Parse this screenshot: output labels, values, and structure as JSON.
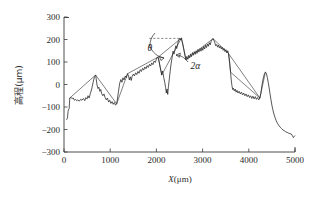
{
  "figure": {
    "background": "#ffffff",
    "line_color": "#1f1f1f"
  },
  "chart_data": {
    "type": "line",
    "title": "",
    "xlabel": "X(μm)",
    "ylabel": "高程(μm)",
    "xlabel_italic_part": "X",
    "xlabel_rest": "(μm)",
    "ylabel_cjk": "高程",
    "ylabel_unit": "(μm)",
    "xlim": [
      0,
      5000
    ],
    "ylim": [
      -300,
      300
    ],
    "xticks": [
      0,
      1000,
      2000,
      3000,
      4000,
      5000
    ],
    "xtick_labels": [
      "0",
      "1000",
      "2000",
      "3000",
      "4000",
      "5000"
    ],
    "yticks": [
      -300,
      -200,
      -100,
      0,
      100,
      200,
      300
    ],
    "ytick_labels": [
      "-300",
      "-200",
      "-100",
      "0",
      "100",
      "200",
      "300"
    ],
    "grid": false,
    "legend": null,
    "legend_position": "none",
    "axis_style": "left-and-bottom-spines",
    "tick_direction": "in",
    "series": [
      {
        "name": "measured surface profile",
        "style": "solid",
        "color": "#1f1f1f",
        "points": [
          [
            60,
            -155
          ],
          [
            75,
            -148
          ],
          [
            88,
            -120
          ],
          [
            100,
            -110
          ],
          [
            112,
            -108
          ],
          [
            125,
            -60
          ],
          [
            150,
            -58
          ],
          [
            175,
            -62
          ],
          [
            200,
            -60
          ],
          [
            225,
            -70
          ],
          [
            250,
            -66
          ],
          [
            275,
            -72
          ],
          [
            300,
            -68
          ],
          [
            330,
            -74
          ],
          [
            360,
            -66
          ],
          [
            390,
            -70
          ],
          [
            420,
            -62
          ],
          [
            450,
            -72
          ],
          [
            470,
            -58
          ],
          [
            500,
            -64
          ],
          [
            520,
            -50
          ],
          [
            545,
            -60
          ],
          [
            570,
            -40
          ],
          [
            600,
            -20
          ],
          [
            630,
            10
          ],
          [
            660,
            35
          ],
          [
            685,
            42
          ],
          [
            700,
            20
          ],
          [
            715,
            -2
          ],
          [
            735,
            -18
          ],
          [
            755,
            -12
          ],
          [
            775,
            -30
          ],
          [
            795,
            -22
          ],
          [
            815,
            -40
          ],
          [
            840,
            -50
          ],
          [
            865,
            -42
          ],
          [
            890,
            -58
          ],
          [
            915,
            -68
          ],
          [
            940,
            -60
          ],
          [
            965,
            -78
          ],
          [
            990,
            -70
          ],
          [
            1015,
            -84
          ],
          [
            1040,
            -76
          ],
          [
            1065,
            -88
          ],
          [
            1090,
            -80
          ],
          [
            1115,
            -92
          ],
          [
            1140,
            -86
          ],
          [
            1160,
            -60
          ],
          [
            1180,
            -30
          ],
          [
            1205,
            5
          ],
          [
            1230,
            22
          ],
          [
            1255,
            10
          ],
          [
            1275,
            30
          ],
          [
            1300,
            20
          ],
          [
            1325,
            38
          ],
          [
            1350,
            30
          ],
          [
            1375,
            48
          ],
          [
            1395,
            40
          ],
          [
            1415,
            20
          ],
          [
            1435,
            34
          ],
          [
            1455,
            18
          ],
          [
            1475,
            36
          ],
          [
            1500,
            46
          ],
          [
            1525,
            38
          ],
          [
            1550,
            52
          ],
          [
            1575,
            44
          ],
          [
            1600,
            58
          ],
          [
            1625,
            50
          ],
          [
            1650,
            66
          ],
          [
            1675,
            58
          ],
          [
            1700,
            72
          ],
          [
            1725,
            64
          ],
          [
            1750,
            78
          ],
          [
            1775,
            70
          ],
          [
            1800,
            84
          ],
          [
            1825,
            76
          ],
          [
            1850,
            90
          ],
          [
            1875,
            82
          ],
          [
            1900,
            96
          ],
          [
            1925,
            88
          ],
          [
            1950,
            104
          ],
          [
            1975,
            98
          ],
          [
            2000,
            112
          ],
          [
            2020,
            122
          ],
          [
            2040,
            118
          ],
          [
            2060,
            100
          ],
          [
            2080,
            78
          ],
          [
            2100,
            60
          ],
          [
            2115,
            42
          ],
          [
            2130,
            60
          ],
          [
            2145,
            48
          ],
          [
            2160,
            30
          ],
          [
            2180,
            10
          ],
          [
            2200,
            -14
          ],
          [
            2215,
            -38
          ],
          [
            2230,
            -20
          ],
          [
            2245,
            -44
          ],
          [
            2260,
            -10
          ],
          [
            2280,
            25
          ],
          [
            2300,
            62
          ],
          [
            2320,
            95
          ],
          [
            2340,
            120
          ],
          [
            2360,
            148
          ],
          [
            2380,
            135
          ],
          [
            2400,
            152
          ],
          [
            2420,
            172
          ],
          [
            2440,
            160
          ],
          [
            2460,
            182
          ],
          [
            2480,
            196
          ],
          [
            2500,
            205
          ],
          [
            2520,
            198
          ],
          [
            2540,
            206
          ],
          [
            2560,
            190
          ],
          [
            2580,
            172
          ],
          [
            2600,
            150
          ],
          [
            2620,
            128
          ],
          [
            2640,
            110
          ],
          [
            2660,
            125
          ],
          [
            2680,
            112
          ],
          [
            2700,
            130
          ],
          [
            2720,
            118
          ],
          [
            2740,
            136
          ],
          [
            2760,
            124
          ],
          [
            2780,
            142
          ],
          [
            2800,
            130
          ],
          [
            2820,
            146
          ],
          [
            2840,
            134
          ],
          [
            2860,
            150
          ],
          [
            2880,
            138
          ],
          [
            2900,
            156
          ],
          [
            2920,
            144
          ],
          [
            2945,
            160
          ],
          [
            2965,
            148
          ],
          [
            2985,
            164
          ],
          [
            3005,
            152
          ],
          [
            3025,
            170
          ],
          [
            3045,
            158
          ],
          [
            3065,
            175
          ],
          [
            3085,
            164
          ],
          [
            3105,
            180
          ],
          [
            3125,
            170
          ],
          [
            3145,
            186
          ],
          [
            3165,
            176
          ],
          [
            3185,
            192
          ],
          [
            3205,
            198
          ],
          [
            3225,
            204
          ],
          [
            3245,
            196
          ],
          [
            3265,
            185
          ],
          [
            3285,
            172
          ],
          [
            3305,
            178
          ],
          [
            3325,
            166
          ],
          [
            3345,
            175
          ],
          [
            3365,
            162
          ],
          [
            3385,
            170
          ],
          [
            3405,
            158
          ],
          [
            3425,
            166
          ],
          [
            3445,
            152
          ],
          [
            3465,
            160
          ],
          [
            3485,
            146
          ],
          [
            3505,
            155
          ],
          [
            3525,
            140
          ],
          [
            3545,
            150
          ],
          [
            3560,
            138
          ],
          [
            3575,
            120
          ],
          [
            3590,
            90
          ],
          [
            3605,
            55
          ],
          [
            3620,
            20
          ],
          [
            3635,
            -5
          ],
          [
            3650,
            -22
          ],
          [
            3665,
            -16
          ],
          [
            3685,
            -28
          ],
          [
            3705,
            -20
          ],
          [
            3725,
            -34
          ],
          [
            3745,
            -26
          ],
          [
            3765,
            -38
          ],
          [
            3790,
            -30
          ],
          [
            3815,
            -42
          ],
          [
            3840,
            -34
          ],
          [
            3865,
            -46
          ],
          [
            3890,
            -38
          ],
          [
            3915,
            -50
          ],
          [
            3940,
            -42
          ],
          [
            3965,
            -54
          ],
          [
            3990,
            -46
          ],
          [
            4015,
            -58
          ],
          [
            4040,
            -50
          ],
          [
            4065,
            -62
          ],
          [
            4090,
            -52
          ],
          [
            4115,
            -64
          ],
          [
            4140,
            -54
          ],
          [
            4165,
            -66
          ],
          [
            4190,
            -58
          ],
          [
            4215,
            -68
          ],
          [
            4240,
            -60
          ],
          [
            4260,
            -40
          ],
          [
            4280,
            -10
          ],
          [
            4300,
            15
          ],
          [
            4320,
            35
          ],
          [
            4340,
            48
          ],
          [
            4360,
            55
          ],
          [
            4380,
            50
          ],
          [
            4400,
            32
          ],
          [
            4420,
            10
          ],
          [
            4440,
            -15
          ],
          [
            4460,
            -42
          ],
          [
            4480,
            -68
          ],
          [
            4500,
            -92
          ],
          [
            4520,
            -112
          ],
          [
            4545,
            -132
          ],
          [
            4570,
            -148
          ],
          [
            4595,
            -162
          ],
          [
            4620,
            -172
          ],
          [
            4650,
            -182
          ],
          [
            4680,
            -190
          ],
          [
            4710,
            -196
          ],
          [
            4740,
            -202
          ],
          [
            4770,
            -206
          ],
          [
            4800,
            -210
          ],
          [
            4830,
            -213
          ],
          [
            4860,
            -216
          ],
          [
            4890,
            -218
          ],
          [
            4920,
            -220
          ],
          [
            4945,
            -228
          ],
          [
            4965,
            -236
          ],
          [
            4980,
            -232
          ],
          [
            4995,
            -228
          ]
        ]
      },
      {
        "name": "peak envelope polyline",
        "style": "solid",
        "color": "#2a2a2a",
        "points": [
          [
            125,
            -60
          ],
          [
            685,
            42
          ],
          [
            1140,
            -86
          ],
          [
            1375,
            48
          ],
          [
            2040,
            122
          ],
          [
            2115,
            42
          ],
          [
            2540,
            206
          ],
          [
            2640,
            110
          ],
          [
            3225,
            204
          ],
          [
            3560,
            138
          ],
          [
            3605,
            55
          ],
          [
            4240,
            -60
          ],
          [
            4360,
            55
          ]
        ]
      },
      {
        "name": "envelope segment b",
        "style": "solid",
        "color": "#2a2a2a",
        "points": [
          [
            2040,
            122
          ],
          [
            2540,
            206
          ]
        ]
      },
      {
        "name": "envelope segment c",
        "style": "solid",
        "color": "#2a2a2a",
        "points": [
          [
            3560,
            138
          ],
          [
            4240,
            -60
          ]
        ]
      }
    ],
    "reference_line": {
      "name": "horizontal reference at peak",
      "style": "dashed",
      "y": 205,
      "x_start": 1845,
      "x_end": 2560
    },
    "annotations": [
      {
        "name": "theta",
        "text": "θ",
        "x": 1810,
        "y": 148,
        "meaning": "inclination angle between reference line and envelope"
      },
      {
        "name": "two-alpha",
        "text": "2α",
        "x": 2740,
        "y": 68,
        "meaning": "included angle of valley"
      }
    ]
  }
}
